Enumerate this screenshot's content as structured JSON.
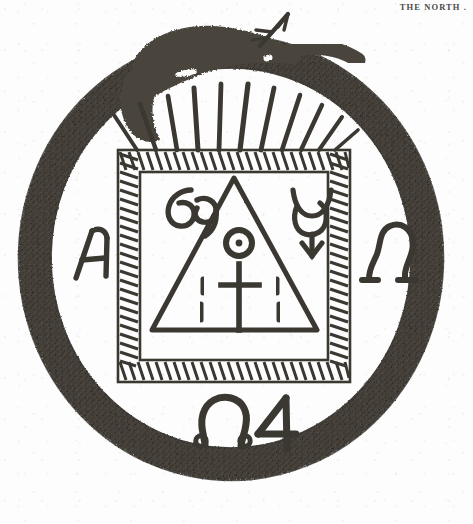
{
  "page": {
    "running_head": "THE NORTH .",
    "background_color": "#fdfdfd",
    "ink_color": "#3a3733",
    "ink_color_light": "#5c564e",
    "width": 473,
    "height": 524
  },
  "emblem": {
    "title": "Ouroboros alchemical emblem",
    "ring": {
      "name": "ouroboros-serpent-ring",
      "description": "serpent devouring its own tail forming a closed circle",
      "center_x": 231,
      "center_y": 258,
      "radius_x": 212,
      "radius_y": 222,
      "band_thickness": 34,
      "fill_color": "#4d4840"
    },
    "serpent_head": {
      "name": "serpent-head",
      "description": "serpent head at top biting the tail",
      "eye": "white slit eye"
    },
    "dart": {
      "name": "dart-arrow",
      "description": "barbed arrow / dart emerging upward-right from the serpent mouth",
      "direction": "up-right"
    },
    "rays": {
      "name": "radiating-rays",
      "count": 11,
      "description": "tapering rays fanning from the top edge of the square up to the ring"
    },
    "square": {
      "name": "hatched-square-frame",
      "x": 118,
      "y": 150,
      "size": 232,
      "border_style": "cross-hatched tick band",
      "inner_inset": 22
    },
    "triangle": {
      "name": "equilateral-triangle",
      "description": "open triangle inscribed within the square"
    },
    "symbols": {
      "top_left": {
        "name": "cancer-symbol",
        "glyph": "69",
        "meaning": "Cancer"
      },
      "top_right": {
        "name": "mercury-symbol",
        "glyph": "☿",
        "meaning": "Mercury / horned crescent with downward arrow"
      },
      "center_sun": {
        "name": "sun-symbol",
        "glyph": "☉",
        "meaning": "Sun — circle with central dot"
      },
      "center_cross": {
        "name": "latin-cross-symbol",
        "glyph": "†",
        "meaning": "cross"
      },
      "dashes_left": {
        "name": "tally-dashes-left",
        "count": 2
      },
      "dashes_right": {
        "name": "tally-dashes-right",
        "count": 2
      },
      "left_letter": {
        "name": "alpha-letter",
        "glyph": "A",
        "meaning": "Alpha"
      },
      "right_letter": {
        "name": "omega-letter",
        "glyph": "Ω",
        "meaning": "Omega"
      },
      "bottom_omega": {
        "name": "omega-symbol-bottom",
        "glyph": "Ω",
        "meaning": "Omega"
      },
      "bottom_jupiter": {
        "name": "jupiter-symbol",
        "glyph": "4",
        "meaning": "Jupiter"
      }
    }
  }
}
